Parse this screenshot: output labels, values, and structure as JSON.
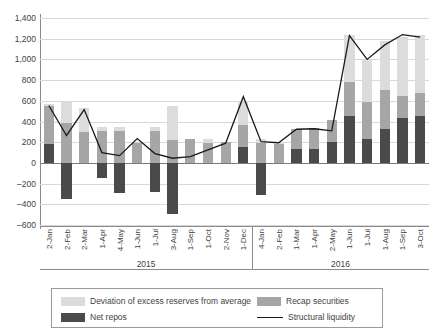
{
  "chart_data": {
    "type": "bar",
    "title": "",
    "subtitle": "",
    "xlabel": "",
    "ylabel": "",
    "ylim": [
      -600,
      1400
    ],
    "ytick_step": 200,
    "yticks": [
      "1,400",
      "1,200",
      "1,000",
      "800",
      "600",
      "400",
      "200",
      "0",
      "–200",
      "–400",
      "–600"
    ],
    "ytick_values": [
      1400,
      1200,
      1000,
      800,
      600,
      400,
      200,
      0,
      -200,
      -400,
      -600
    ],
    "grid": true,
    "legend_position": "bottom",
    "stacked": true,
    "categories": [
      "2-Jan",
      "2-Feb",
      "2-Mar",
      "1-Apr",
      "4-May",
      "1-Jun",
      "1-Jul",
      "3-Aug",
      "1-Sep",
      "1-Oct",
      "2-Nov",
      "1-Dec",
      "4-Jan",
      "2-Feb",
      "1-Mar",
      "1-Apr",
      "2-May",
      "1-Jun",
      "1-Jul",
      "1-Aug",
      "1-Sep",
      "3-Oct"
    ],
    "group_labels": [
      {
        "label": "2015",
        "start": 0,
        "end": 11
      },
      {
        "label": "2016",
        "start": 12,
        "end": 21
      }
    ],
    "series": [
      {
        "name": "Net repos",
        "key": "net_repos",
        "color": "#4a4a4a",
        "values": [
          180,
          -350,
          0,
          -150,
          -290,
          0,
          -280,
          -490,
          0,
          0,
          0,
          150,
          -310,
          0,
          130,
          130,
          200,
          450,
          230,
          330,
          430,
          450
        ]
      },
      {
        "name": "Recap securities",
        "key": "recap_securities",
        "color": "#a6a6a6",
        "values": [
          370,
          385,
          300,
          310,
          305,
          195,
          310,
          220,
          230,
          190,
          200,
          220,
          190,
          180,
          195,
          210,
          215,
          330,
          360,
          370,
          220,
          230
        ]
      },
      {
        "name": "Deviation of excess reserves from average",
        "key": "deviation_excess_reserves",
        "color": "#dcdcdc",
        "values": [
          20,
          215,
          230,
          40,
          45,
          0,
          40,
          325,
          0,
          40,
          0,
          230,
          45,
          20,
          0,
          0,
          0,
          460,
          400,
          480,
          570,
          560
        ]
      }
    ],
    "line_series": {
      "name": "Structural liquidity",
      "color": "#1a1a1a",
      "values": [
        555,
        265,
        515,
        100,
        70,
        235,
        90,
        45,
        60,
        125,
        190,
        640,
        205,
        195,
        325,
        330,
        310,
        1230,
        1000,
        1140,
        1240,
        1215
      ]
    },
    "legend": [
      {
        "label": "Deviation of excess reserves from average",
        "type": "swatch",
        "color": "#dcdcdc"
      },
      {
        "label": "Recap securities",
        "type": "swatch",
        "color": "#a6a6a6"
      },
      {
        "label": "Net repos",
        "type": "swatch",
        "color": "#4a4a4a"
      },
      {
        "label": "Structural liquidity",
        "type": "line",
        "color": "#1a1a1a"
      }
    ]
  }
}
